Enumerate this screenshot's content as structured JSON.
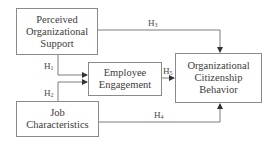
{
  "diagram": {
    "type": "path-model",
    "nodes": [
      {
        "id": "pos",
        "label": "Perceived\nOrganizational\nSupport"
      },
      {
        "id": "ee",
        "label": "Employee\nEngagement"
      },
      {
        "id": "jc",
        "label": "Job\nCharacteristics"
      },
      {
        "id": "ocb",
        "label": "Organizational\nCitizenship\nBehavior"
      }
    ],
    "edges": [
      {
        "id": "h1",
        "from": "pos",
        "to": "ee",
        "label_main": "H",
        "label_sub": "1"
      },
      {
        "id": "h2",
        "from": "jc",
        "to": "ee",
        "label_main": "H",
        "label_sub": "2"
      },
      {
        "id": "h3",
        "from": "pos",
        "to": "ocb",
        "label_main": "H",
        "label_sub": "3"
      },
      {
        "id": "h4",
        "from": "jc",
        "to": "ocb",
        "label_main": "H",
        "label_sub": "4"
      },
      {
        "id": "h5",
        "from": "ee",
        "to": "ocb",
        "label_main": "H",
        "label_sub": "5"
      }
    ],
    "colors": {
      "line": "#5a5a5a",
      "box_border": "#8a8a8a",
      "text": "#3c3c3c"
    }
  }
}
